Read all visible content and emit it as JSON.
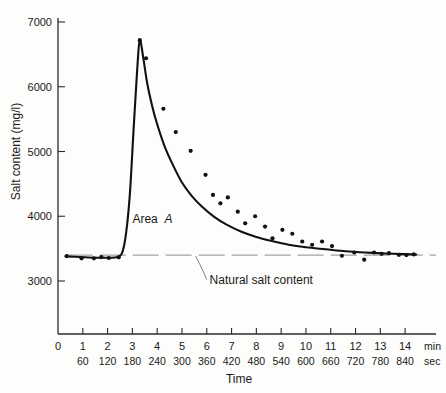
{
  "chart_data": {
    "type": "line",
    "title": "",
    "xlabel": "Time",
    "ylabel": "Salt content (mg/l)",
    "xlim": [
      0,
      14.6
    ],
    "ylim": [
      2550,
      7250
    ],
    "grid": false,
    "legend": "none",
    "x_unit_primary": "min",
    "x_unit_secondary": "sec",
    "x_ticks_min": [
      0,
      1,
      2,
      3,
      4,
      5,
      6,
      7,
      8,
      9,
      10,
      11,
      12,
      13,
      14
    ],
    "x_tick_labels_min": [
      "0",
      "1",
      "2",
      "3",
      "4",
      "5",
      "6",
      "7",
      "8",
      "9",
      "10",
      "11",
      "12",
      "13",
      "14"
    ],
    "x_ticks_sec": [
      60,
      120,
      180,
      240,
      300,
      360,
      420,
      480,
      540,
      600,
      660,
      720,
      780,
      840
    ],
    "x_tick_labels_sec": [
      "60",
      "120",
      "180",
      "240",
      "300",
      "360",
      "420",
      "480",
      "540",
      "600",
      "660",
      "720",
      "780",
      "840"
    ],
    "y_ticks": [
      3000,
      4000,
      5000,
      6000,
      7000
    ],
    "y_tick_labels": [
      "3000",
      "4000",
      "5000",
      "6000",
      "7000"
    ],
    "natural_salt_content": 3400,
    "peak_value": 6720,
    "peak_time_min": 3.3,
    "series": [
      {
        "name": "Salt content curve",
        "kind": "line",
        "x": [
          0.3,
          0.9,
          1.5,
          2.0,
          2.4,
          2.6,
          2.75,
          2.9,
          3.05,
          3.2,
          3.3,
          3.45,
          3.6,
          3.8,
          4.0,
          4.3,
          4.6,
          5.0,
          5.4,
          5.8,
          6.3,
          6.8,
          7.4,
          8.0,
          8.6,
          9.3,
          10.0,
          10.8,
          11.6,
          12.4,
          13.2,
          14.0,
          14.45
        ],
        "y": [
          3380,
          3370,
          3360,
          3360,
          3370,
          3450,
          3750,
          4350,
          5350,
          6300,
          6720,
          6420,
          6050,
          5700,
          5420,
          5080,
          4820,
          4520,
          4310,
          4150,
          3990,
          3870,
          3760,
          3680,
          3620,
          3560,
          3520,
          3490,
          3460,
          3440,
          3425,
          3415,
          3410
        ]
      },
      {
        "name": "Measured samples",
        "kind": "scatter",
        "x": [
          0.35,
          0.95,
          1.45,
          1.75,
          2.05,
          2.45,
          3.3,
          3.55,
          4.25,
          4.75,
          5.35,
          5.95,
          6.25,
          6.55,
          6.85,
          7.25,
          7.55,
          7.95,
          8.35,
          8.65,
          9.05,
          9.45,
          9.85,
          10.25,
          10.65,
          11.05,
          11.45,
          11.95,
          12.35,
          12.75,
          13.05,
          13.35,
          13.75,
          14.05,
          14.35
        ],
        "y": [
          3385,
          3350,
          3350,
          3370,
          3355,
          3365,
          6720,
          6440,
          5660,
          5300,
          5010,
          4640,
          4330,
          4200,
          4290,
          4070,
          3890,
          4000,
          3840,
          3660,
          3790,
          3730,
          3610,
          3560,
          3610,
          3540,
          3390,
          3440,
          3330,
          3440,
          3420,
          3430,
          3405,
          3400,
          3410
        ]
      }
    ],
    "annotations": [
      {
        "name": "area-a",
        "text": "Area",
        "text_italic": "A",
        "x_min": 3.0,
        "y_value": 3900
      },
      {
        "name": "natural-salt-content",
        "text": "Natural salt content",
        "x_min": 7.0,
        "y_value": 2960
      }
    ]
  }
}
